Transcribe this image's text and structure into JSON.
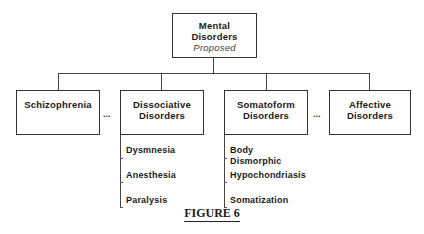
{
  "root": {
    "title_line1": "Mental",
    "title_line2": "Disorders",
    "subtitle": "Proposed"
  },
  "categories": [
    {
      "line1": "Schizophrenia",
      "line2": ""
    },
    {
      "line1": "Dissociative",
      "line2": "Disorders"
    },
    {
      "line1": "Somatoform",
      "line2": "Disorders"
    },
    {
      "line1": "Affective",
      "line2": "Disorders"
    }
  ],
  "ellipses": [
    "...",
    "..."
  ],
  "dissociative_items": [
    "Dysmnesia",
    "Anesthesia",
    "Paralysis"
  ],
  "somatoform_items": [
    "Body",
    "Dismorphic",
    "Hypochondriasis",
    "Somatization"
  ],
  "caption": "FIGURE 6"
}
